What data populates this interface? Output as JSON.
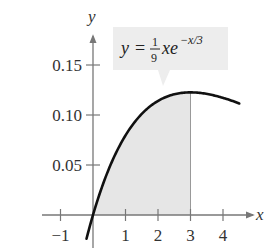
{
  "chart_data": {
    "type": "area",
    "title": "",
    "equation": {
      "lhs": "y",
      "equals": "=",
      "frac_num": "1",
      "frac_den": "9",
      "body": "xe",
      "exponent": "−x/3",
      "full": "y = (1/9) x e^(−x/3)"
    },
    "xlabel": "x",
    "ylabel": "y",
    "xlim": [
      -1.1,
      4.7
    ],
    "ylim": [
      -0.03,
      0.19
    ],
    "x_ticks": [
      -1,
      1,
      2,
      3,
      4
    ],
    "x_tick_labels": [
      "−1",
      "1",
      "2",
      "3",
      "4"
    ],
    "y_ticks": [
      0.05,
      0.1,
      0.15
    ],
    "y_tick_labels": [
      "0.05",
      "0.10",
      "0.15"
    ],
    "grid": false,
    "legend": null,
    "shaded_region": {
      "from": 0,
      "to": 3,
      "color": "#e6e6e6"
    },
    "curve": {
      "x": [
        -0.2,
        0,
        0.5,
        1,
        1.5,
        2,
        2.5,
        3,
        3.5,
        4,
        4.5
      ],
      "y": [
        -0.024,
        0,
        0.047,
        0.08,
        0.101,
        0.114,
        0.12,
        0.123,
        0.121,
        0.117,
        0.112
      ]
    },
    "colors": {
      "curve": "#111111",
      "axis": "#777777",
      "shade": "#e6e6e6",
      "callout": "#ededed"
    }
  }
}
